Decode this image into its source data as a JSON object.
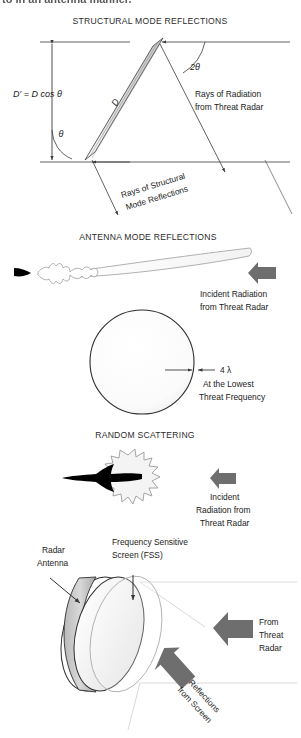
{
  "page": {
    "cutoff_text_top": "to in an antenna manner."
  },
  "panels": [
    {
      "id": "structural-mode",
      "heading": "STRUCTURAL MODE REFLECTIONS",
      "labels": {
        "dprime": "D′ = D cos θ",
        "plate_dim": "D",
        "theta": "θ",
        "two_theta": "2θ",
        "incident_line1": "Rays of Radiation",
        "incident_line2": "from Threat Radar",
        "reflect_line1": "Rays of Structural",
        "reflect_line2": "Mode Reflections"
      }
    },
    {
      "id": "antenna-mode",
      "heading": "ANTENNA MODE REFLECTIONS",
      "labels": {
        "incident_line1": "Incident Radiation",
        "incident_line2": "from Threat Radar"
      }
    },
    {
      "id": "sphere-criterion",
      "heading": "",
      "labels": {
        "wavelength": "4 λ",
        "cond_line1": "At the Lowest",
        "cond_line2": "Threat Frequency"
      }
    },
    {
      "id": "random-scattering",
      "heading": "RANDOM SCATTERING",
      "labels": {
        "incident_line1": "Incident",
        "incident_line2": "Radiation from",
        "incident_line3": "Threat Radar"
      }
    },
    {
      "id": "fss-antenna",
      "heading": "",
      "labels": {
        "antenna_line1": "Radar",
        "antenna_line2": "Antenna",
        "fss_line1": "Frequency Sensitive",
        "fss_line2": "Screen (FSS)",
        "from_line1": "From",
        "from_line2": "Threat",
        "from_line3": "Radar",
        "refl_line1": "Reflections",
        "refl_line2": "from Screen"
      }
    }
  ],
  "colors": {
    "arrow_gray": "#6e6e6e",
    "plate_fill": "#d8d8d8",
    "line": "#3a3a3a",
    "faint_line": "#b8b8b8",
    "aircraft_black": "#000000",
    "dish_gray": "#cfcfcf"
  }
}
